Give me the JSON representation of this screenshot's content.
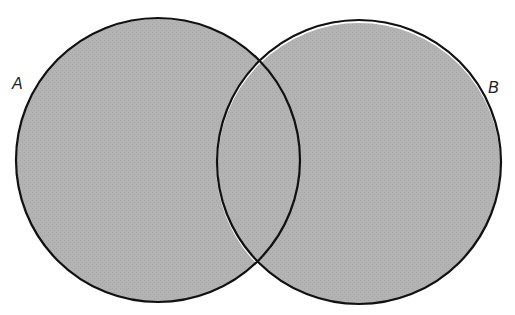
{
  "diagram": {
    "type": "venn",
    "fill_color": "#b3b3b3",
    "stroke_color": "#111111",
    "background": "#ffffff",
    "sets": [
      {
        "id": "A",
        "label": "A",
        "cx": 158,
        "cy": 160,
        "r": 142,
        "label_x": 12,
        "label_y": 89
      },
      {
        "id": "B",
        "label": "B",
        "cx": 359,
        "cy": 162,
        "r": 142,
        "label_x": 488,
        "label_y": 93
      }
    ]
  }
}
